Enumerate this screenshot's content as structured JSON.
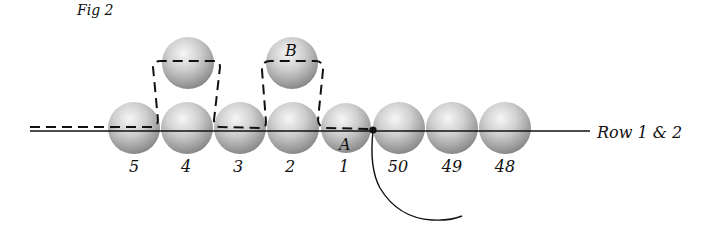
{
  "figure": {
    "title": "Fig 2",
    "row_label": "Row 1 & 2",
    "point_labels": {
      "a": "A",
      "b": "B"
    },
    "colors": {
      "line": "#111111",
      "bead_light": "#f4f4f4",
      "bead_mid": "#bdbdbd",
      "bead_dark": "#7a7a7a"
    }
  },
  "beads": {
    "row": [
      {
        "label": "5",
        "cx": 134
      },
      {
        "label": "4",
        "cx": 187
      },
      {
        "label": "3",
        "cx": 240
      },
      {
        "label": "2",
        "cx": 293
      },
      {
        "label": "1",
        "cx": 346
      },
      {
        "label": "50",
        "cx": 399
      },
      {
        "label": "49",
        "cx": 452
      },
      {
        "label": "48",
        "cx": 505
      }
    ],
    "top": [
      {
        "id": "top-above-4",
        "cx": 188
      },
      {
        "id": "top-B-above-2",
        "cx": 292
      }
    ]
  }
}
